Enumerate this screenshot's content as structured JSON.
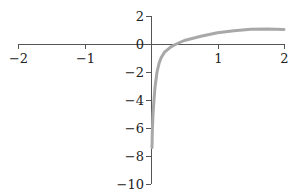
{
  "chart_data": {
    "type": "line",
    "title": "",
    "xlabel": "",
    "ylabel": "",
    "xlim": [
      -2,
      2
    ],
    "ylim": [
      -10,
      2
    ],
    "grid": false,
    "legend": null,
    "x_ticks": [
      "-2",
      "-1",
      "1",
      "2"
    ],
    "y_ticks": [
      "2",
      "0",
      "-2",
      "-4",
      "-6",
      "-8",
      "-10"
    ],
    "series": [
      {
        "name": "curve",
        "color": "#a8a8a8",
        "x": [
          0.015,
          0.02,
          0.03,
          0.045,
          0.06,
          0.09,
          0.12,
          0.15,
          0.2,
          0.3,
          0.38,
          0.5,
          0.75,
          1.0,
          1.25,
          1.5,
          1.75,
          2.0
        ],
        "y": [
          -7.4,
          -6.3,
          -5.0,
          -4.0,
          -3.1,
          -2.0,
          -1.4,
          -1.0,
          -0.6,
          -0.2,
          0.0,
          0.25,
          0.55,
          0.8,
          0.95,
          1.05,
          1.08,
          1.04
        ]
      }
    ]
  },
  "colors": {
    "axis": "#555555",
    "curve": "#a8a8a8"
  }
}
